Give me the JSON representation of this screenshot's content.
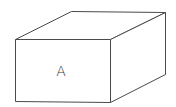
{
  "diagram": {
    "type": "3d-box",
    "label": "A",
    "stroke_color": "#4a4a4a",
    "background": "#ffffff",
    "vertices": {
      "front_top_left": [
        15,
        39
      ],
      "front_top_right": [
        110,
        39
      ],
      "front_bottom_right": [
        110,
        102
      ],
      "front_bottom_left": [
        15,
        101
      ],
      "back_top_left": [
        71,
        11
      ],
      "back_top_right": [
        165,
        12
      ],
      "back_bottom_right": [
        165,
        74
      ]
    }
  }
}
